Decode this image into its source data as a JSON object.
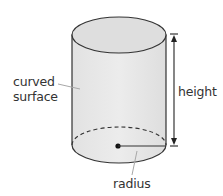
{
  "diagram": {
    "shape": "cylinder",
    "labels": {
      "curved_surface_line1": "curved",
      "curved_surface_line2": "surface",
      "height": "height",
      "radius": "radius"
    },
    "colors": {
      "fill_body": "#e4e4e4",
      "fill_top": "#dcdcdc",
      "stroke": "#333333",
      "pointer": "#a8a8a8"
    }
  }
}
